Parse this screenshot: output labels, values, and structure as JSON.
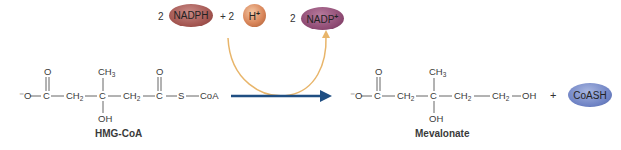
{
  "cofactors": {
    "nadph": {
      "coef": "2",
      "label": "NADPH",
      "color": "#a2544f"
    },
    "plus1": "+ 2",
    "hplus": {
      "label": "H",
      "sup": "+",
      "color": "#d9865a"
    },
    "nadp": {
      "coef": "2",
      "label": "NADP",
      "sup": "+",
      "color": "#8e4a73"
    }
  },
  "hmg_coa": {
    "name": "HMG-CoA",
    "o_minus": "⁻O",
    "c1": "C",
    "o1": "O",
    "ch2_a": "CH",
    "c_center": "C",
    "ch3": "CH",
    "oh": "OH",
    "ch2_b": "CH",
    "c2": "C",
    "o2": "O",
    "s": "S",
    "coa": "CoA",
    "sub2": "2",
    "sub3": "3"
  },
  "mevalonate": {
    "name": "Mevalonate",
    "o_minus": "⁻O",
    "c1": "C",
    "o1": "O",
    "ch2_a": "CH",
    "c_center": "C",
    "ch3": "CH",
    "oh": "OH",
    "ch2_b": "CH",
    "ch2_c": "CH",
    "oh_end": "OH",
    "sub2": "2",
    "sub3": "3"
  },
  "products": {
    "plus": "+",
    "coash": {
      "label": "CoASH",
      "color": "#6e82c4"
    }
  },
  "colors": {
    "reaction_arrow": "#1f4e82",
    "cofactor_arc": "#e8b56a",
    "bond": "#555555"
  }
}
